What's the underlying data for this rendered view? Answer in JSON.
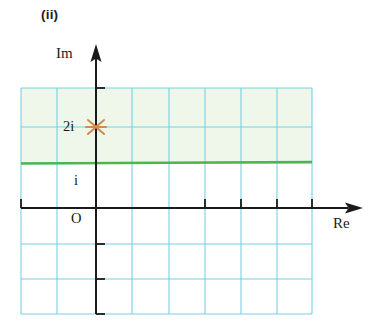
{
  "figure": {
    "label": "(ii)",
    "type": "argand-diagram"
  },
  "axes": {
    "imaginary_label": "Im",
    "real_label": "Re",
    "origin_label": "O"
  },
  "points": [
    {
      "label": "2i",
      "marker": "cross-star",
      "color": "#d38b4e",
      "re": 0,
      "im": 2
    }
  ],
  "ticks": [
    {
      "label": "i",
      "re": 0,
      "im": 1
    }
  ],
  "boundary_line": {
    "color": "#4cb64c",
    "style": "solid",
    "orientation": "horizontal",
    "im_value": 1.25
  },
  "shaded_region": {
    "fill": "#eef7ea",
    "position": "above-boundary-line"
  },
  "grid": {
    "color": "#6fcfe3",
    "columns": 8,
    "rows": 6,
    "cell_size": 36
  },
  "colors": {
    "axis": "#1a1a1a",
    "grid": "#6fcfe3",
    "green_line": "#4cb64c",
    "shade": "#eef7ea",
    "marker": "#d38b4e",
    "text": "#1a1a1a"
  }
}
